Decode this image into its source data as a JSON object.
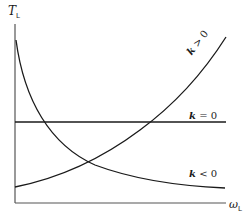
{
  "diagram": {
    "y_axis": {
      "symbol": "T",
      "subscript": "L"
    },
    "x_axis": {
      "symbol": "ω",
      "subscript": "L"
    },
    "curves": [
      {
        "id": "k_positive",
        "k_symbol": "k",
        "relation": "> 0",
        "shape": "increasing"
      },
      {
        "id": "k_zero",
        "k_symbol": "k",
        "relation": "= 0",
        "shape": "constant"
      },
      {
        "id": "k_negative",
        "k_symbol": "k",
        "relation": "< 0",
        "shape": "decreasing"
      }
    ],
    "colors": {
      "line": "#1a1a1a",
      "axis": "#555555",
      "background": "#ffffff"
    }
  }
}
